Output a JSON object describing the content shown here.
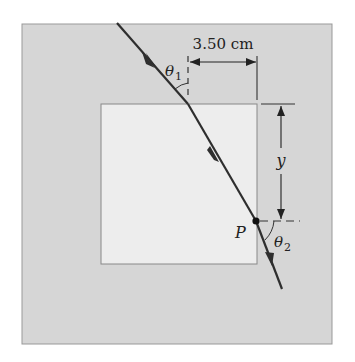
{
  "diagram": {
    "colors": {
      "outer_medium": "#d6d6d6",
      "inner_block": "#ededed",
      "ray": "#2e2e2e",
      "lines": "#333333",
      "background": "#ffffff"
    },
    "labels": {
      "width_dimension": "3.50 cm",
      "theta1": "θ",
      "theta1_sub": "1",
      "theta2": "θ",
      "theta2_sub": "2",
      "y_dimension": "y",
      "point": "P"
    }
  }
}
